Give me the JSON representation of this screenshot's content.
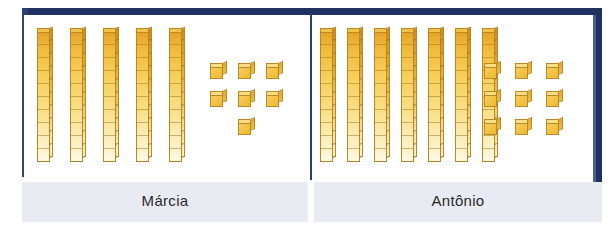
{
  "figure": {
    "type": "base-ten-blocks-comparison",
    "colors": {
      "frame_border": "#1f3160",
      "divider": "#2a3e71",
      "label_band": "#e9ebf3",
      "label_text": "#2a2a2a",
      "block_gold": "#f2bc3e",
      "block_outline": "#b98a21",
      "panel_background": "#ffffff"
    }
  },
  "panels": [
    {
      "id": "left",
      "label": "Márcia",
      "tens_rods": 5,
      "unit_cubes": 7,
      "units_per_rod": 10,
      "total": 57,
      "cube_layout": [
        3,
        3,
        1
      ]
    },
    {
      "id": "right",
      "label": "Antônio",
      "tens_rods": 7,
      "unit_cubes": 9,
      "units_per_rod": 10,
      "total": 79,
      "cube_layout": [
        3,
        3,
        3
      ]
    }
  ]
}
